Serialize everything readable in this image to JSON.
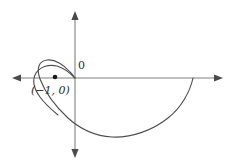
{
  "figure": {
    "background_color": "#ffffff",
    "axis_color": "#808080",
    "curve_color": "#4f4f4f",
    "point_color": "#1a1a1a",
    "origin_label": "0",
    "point_label": "(−1, 0)"
  },
  "chart_data": {
    "type": "line",
    "title": "",
    "subtitle": "",
    "xlabel": "",
    "ylabel": "",
    "grid": false,
    "legend": null,
    "axes": {
      "x_axis": {
        "label": "",
        "arrow_both_ends": true,
        "pixel_y": 78,
        "pixel_x_start": 13,
        "pixel_x_end": 222
      },
      "y_axis": {
        "label": "",
        "arrow_both_ends": true,
        "pixel_x": 75,
        "pixel_y_start": 12,
        "pixel_y_end": 157
      },
      "origin_pixel": [
        75,
        78
      ]
    },
    "annotations": [
      {
        "text": "0",
        "meaning": "origin-label",
        "pixel": [
          80,
          66
        ]
      },
      {
        "text": "(−1, 0)",
        "meaning": "marked-point-label",
        "pixel": [
          55,
          92
        ]
      }
    ],
    "points": [
      {
        "label": "(−1, 0)",
        "x": -1,
        "y": 0,
        "pixel": [
          55,
          77
        ],
        "style": "filled-dot"
      }
    ],
    "curve": {
      "name": "limacon-with-inner-loop",
      "description": "Polar curve r = 1 + 2 cos(theta): large outer arc sweeping right and below the x-axis, with a small inner loop to the left of the origin passing through the origin.",
      "closed": false,
      "path_d": "M 193 78 C 182 96 168 114 150 125 C 130 137 108 139 92 133 C 74 126 61 113 50 100 C 40 88 34 76 36 68 C 38 61 46 58 54 60 C 62 62 69 69 75 78 C 69 69 62 62 54 60 C 46 58 38 61 36 68 C 34 76 40 88 50 100",
      "outer_arc": {
        "start_pixel": [
          193,
          78
        ],
        "bottom_pixel": [
          112,
          137
        ],
        "end_pixel": [
          75,
          78
        ]
      },
      "inner_loop": {
        "left_pixel": [
          34,
          79
        ],
        "top_pixel": [
          55,
          61
        ],
        "through_origin_pixel": [
          75,
          78
        ]
      }
    }
  }
}
